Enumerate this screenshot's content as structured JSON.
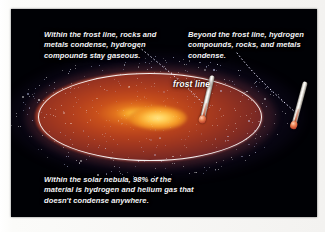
{
  "figure": {
    "panel_background": "#000105"
  },
  "captions": {
    "inner_zone": "Within the frost line, rocks and metals condense, hydrogen compounds stay gaseous.",
    "outer_zone": "Beyond the frost line, hydrogen compounds, rocks, and metals condense.",
    "nebula_note": "Within the solar nebula, 98% of the material is hydrogen and helium gas that doesn't condense anywhere."
  },
  "labels": {
    "frost_line": "frost line"
  },
  "icons": {
    "thermometer_inner": "thermometer-icon",
    "thermometer_outer": "thermometer-icon"
  },
  "colors": {
    "panel": "#000105",
    "disk_core": "#ffd24a",
    "disk_mid": "#c9501b",
    "disk_outer": "#5a2030",
    "nebula_haze": "#784a8c",
    "frost_ellipse": "#ffffff",
    "caption_text": "#f2f3f6",
    "thermometer_bulb": "#c4512c"
  },
  "diagram_data": {
    "type": "annotated-illustration",
    "subject": "protoplanetary solar nebula disk",
    "regions": [
      {
        "name": "inner region",
        "description": "inside the frost line"
      },
      {
        "name": "outer region",
        "description": "beyond the frost line"
      }
    ],
    "markers": [
      "frost line ellipse",
      "inner thermometer",
      "outer thermometer"
    ],
    "composition_percent_gas": 98
  }
}
